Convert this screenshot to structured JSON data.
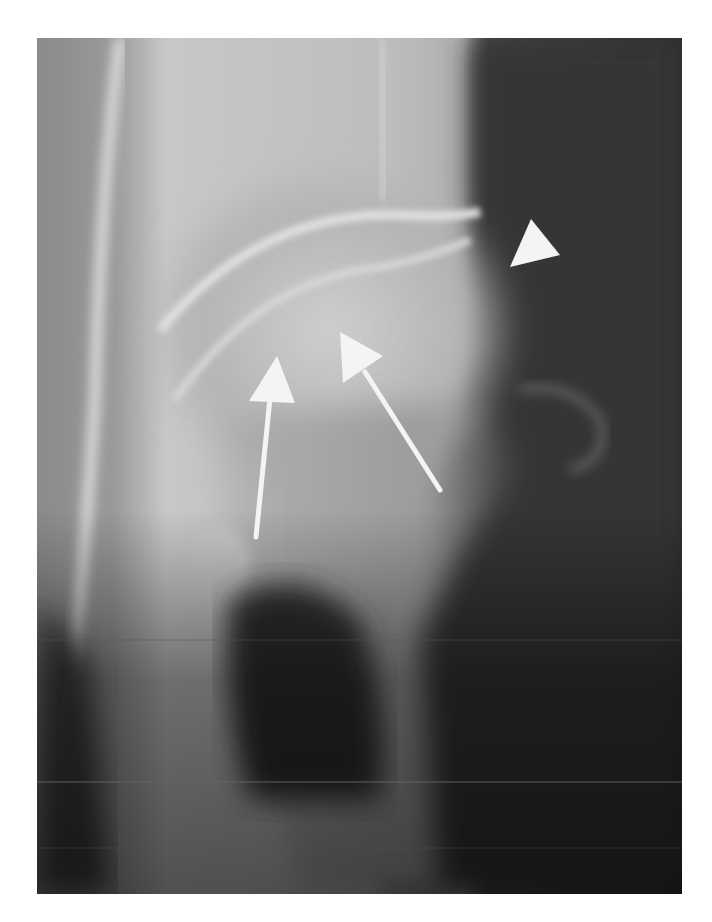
{
  "figure": {
    "type": "radiograph",
    "annotations": [
      {
        "kind": "arrow",
        "name": "left-arrow",
        "tip": [
          277,
          356
        ],
        "tail": [
          256,
          537
        ]
      },
      {
        "kind": "arrow",
        "name": "middle-arrow",
        "tip": [
          340,
          332
        ],
        "tail": [
          440,
          490
        ]
      },
      {
        "kind": "arrowhead",
        "name": "right-arrowhead",
        "points": [
          [
            531,
            219
          ],
          [
            560,
            255
          ],
          [
            510,
            267
          ]
        ]
      }
    ],
    "colors": {
      "background": "#ffffff",
      "annotation": "#f4f4f4",
      "soft_tissue_dark": "#2a2a2a",
      "bone_light": "#d6d6d6"
    }
  }
}
